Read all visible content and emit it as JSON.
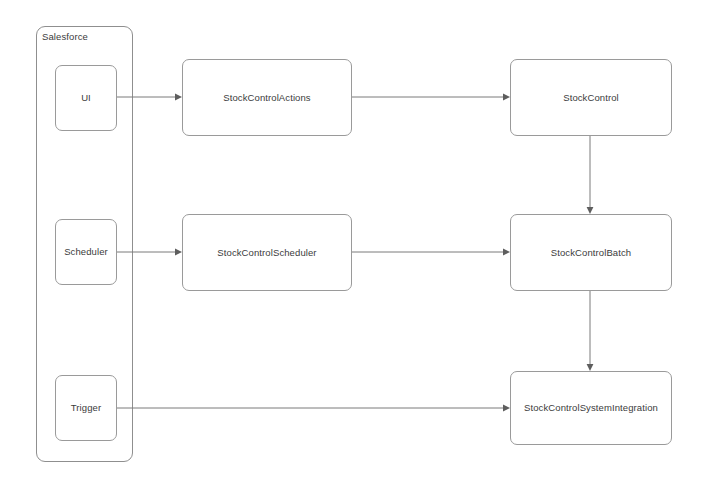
{
  "diagram": {
    "background_color": "#ffffff",
    "line_color": "#7a7a7a",
    "text_color": "#3b3b3b",
    "group": {
      "label": "Salesforce",
      "x": 36,
      "y": 26,
      "width": 97,
      "height": 436
    },
    "nodes": [
      {
        "id": "ui",
        "label": "UI",
        "x": 55,
        "y": 65,
        "width": 62,
        "height": 66,
        "shape": "rounded"
      },
      {
        "id": "scheduler",
        "label": "Scheduler",
        "x": 55,
        "y": 219,
        "width": 62,
        "height": 66,
        "shape": "rounded"
      },
      {
        "id": "trigger",
        "label": "Trigger",
        "x": 55,
        "y": 375,
        "width": 62,
        "height": 66,
        "shape": "rounded"
      },
      {
        "id": "actions",
        "label": "StockControlActions",
        "x": 182,
        "y": 59,
        "width": 170,
        "height": 77,
        "shape": "rounded"
      },
      {
        "id": "sched_class",
        "label": "StockControlScheduler",
        "x": 182,
        "y": 214,
        "width": 170,
        "height": 77,
        "shape": "rounded"
      },
      {
        "id": "stockcontrol",
        "label": "StockControl",
        "x": 510,
        "y": 59,
        "width": 162,
        "height": 77,
        "shape": "rounded"
      },
      {
        "id": "batch",
        "label": "StockControlBatch",
        "x": 510,
        "y": 214,
        "width": 162,
        "height": 77,
        "shape": "rounded"
      },
      {
        "id": "integration",
        "label": "StockControlSystemIntegration",
        "x": 510,
        "y": 371,
        "width": 162,
        "height": 74,
        "shape": "rounded"
      }
    ],
    "edges": [
      {
        "id": "ui-to-actions",
        "from": "ui",
        "to": "actions",
        "x1": 117,
        "y1": 97,
        "x2": 182,
        "y2": 97,
        "direction": "horizontal"
      },
      {
        "id": "actions-to-stockcontrol",
        "from": "actions",
        "to": "stockcontrol",
        "x1": 352,
        "y1": 97,
        "x2": 510,
        "y2": 97,
        "direction": "horizontal"
      },
      {
        "id": "scheduler-to-class",
        "from": "scheduler",
        "to": "sched_class",
        "x1": 117,
        "y1": 252,
        "x2": 182,
        "y2": 252,
        "direction": "horizontal"
      },
      {
        "id": "class-to-batch",
        "from": "sched_class",
        "to": "batch",
        "x1": 352,
        "y1": 252,
        "x2": 510,
        "y2": 252,
        "direction": "horizontal"
      },
      {
        "id": "trigger-to-integration",
        "from": "trigger",
        "to": "integration",
        "x1": 117,
        "y1": 408,
        "x2": 510,
        "y2": 408,
        "direction": "horizontal"
      },
      {
        "id": "stockcontrol-to-batch",
        "from": "stockcontrol",
        "to": "batch",
        "x1": 590,
        "y1": 136,
        "x2": 590,
        "y2": 214,
        "direction": "vertical"
      },
      {
        "id": "batch-to-integration",
        "from": "batch",
        "to": "integration",
        "x1": 590,
        "y1": 291,
        "x2": 590,
        "y2": 371,
        "direction": "vertical"
      }
    ]
  }
}
